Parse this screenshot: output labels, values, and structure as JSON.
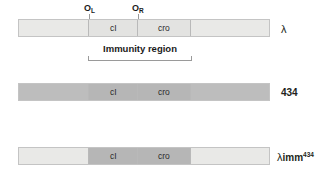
{
  "figure": {
    "title_hidden": "Phage lambda immunity region hybrids",
    "operator_labels": [
      {
        "name": "O_L",
        "text": "O",
        "sub": "L",
        "x": 86,
        "y": 5
      },
      {
        "name": "O_R",
        "text": "O",
        "sub": "R",
        "x": 134,
        "y": 5
      }
    ],
    "immunity": {
      "caption": "Immunity region",
      "left_x": 88,
      "right_x": 192
    },
    "bars": [
      {
        "name": "lambda-phage",
        "label": "λ",
        "label_bold": false,
        "y": 19,
        "x": 18,
        "width": 252,
        "segments": [
          {
            "label": "",
            "width": 70,
            "shade": "light"
          },
          {
            "label": "cI",
            "width": 49,
            "shade": "light2"
          },
          {
            "label": "cro",
            "width": 53,
            "shade": "light2"
          },
          {
            "label": "",
            "width": 80,
            "shade": "light"
          }
        ]
      },
      {
        "name": "phage-434",
        "label": "434",
        "label_bold": true,
        "y": 83,
        "x": 18,
        "width": 252,
        "segments": [
          {
            "label": "",
            "width": 70,
            "shade": "mid"
          },
          {
            "label": "cI",
            "width": 49,
            "shade": "mid2"
          },
          {
            "label": "cro",
            "width": 53,
            "shade": "mid2"
          },
          {
            "label": "",
            "width": 80,
            "shade": "mid"
          }
        ]
      },
      {
        "name": "lambda-imm434-hybrid",
        "label_lambda": "λ",
        "label_imm": "imm",
        "label_sup": "434",
        "label_bold": true,
        "y": 147,
        "x": 18,
        "width": 252,
        "segments": [
          {
            "label": "",
            "width": 70,
            "shade": "light"
          },
          {
            "label": "cI",
            "width": 49,
            "shade": "mid2"
          },
          {
            "label": "cro",
            "width": 53,
            "shade": "mid2"
          },
          {
            "label": "",
            "width": 80,
            "shade": "light"
          }
        ]
      }
    ],
    "gene_names": {
      "ci": "cI",
      "cro": "cro"
    },
    "colors": {
      "light": "#e9e9e7",
      "light2": "#e3e3e1",
      "mid": "#bdbdbd",
      "mid2": "#b6b6b6",
      "border": "#c4c4c4",
      "text": "#231f20",
      "rule": "#9a9a9a"
    }
  }
}
